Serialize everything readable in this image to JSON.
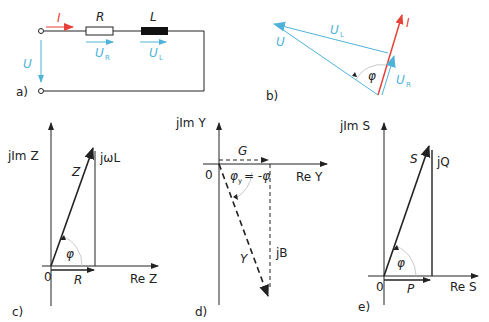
{
  "colors": {
    "current": "#e8413a",
    "voltage": "#4fb3d9",
    "line": "#222222"
  },
  "panels": {
    "a": {
      "caption": "a)",
      "labels": {
        "current": "I",
        "resistor": "R",
        "inductor": "L",
        "voltage": "U",
        "u_r": "U",
        "u_r_sub": "R",
        "u_l": "U",
        "u_l_sub": "L"
      }
    },
    "b": {
      "caption": "b)",
      "labels": {
        "current": "I",
        "voltage": "U",
        "u_l": "U",
        "u_l_sub": "L",
        "u_r": "U",
        "u_r_sub": "R",
        "angle": "φ"
      }
    },
    "c": {
      "caption": "c)",
      "labels": {
        "y_axis": "jIm Z",
        "x_axis": "Re Z",
        "origin": "0",
        "vector": "Z",
        "imag": "jωL",
        "real": "R",
        "angle": "φ"
      }
    },
    "d": {
      "caption": "d)",
      "labels": {
        "y_axis": "jIm Y",
        "x_axis": "Re Y",
        "origin": "0",
        "vector": "Y",
        "imag": "jB",
        "real": "G",
        "angle": "φ",
        "angle_sub": "y",
        "angle_eq": "= -φ"
      }
    },
    "e": {
      "caption": "e)",
      "labels": {
        "y_axis": "jIm S",
        "x_axis": "Re S",
        "origin": "0",
        "vector": "S",
        "imag": "jQ",
        "real": "P",
        "angle": "φ"
      }
    }
  }
}
